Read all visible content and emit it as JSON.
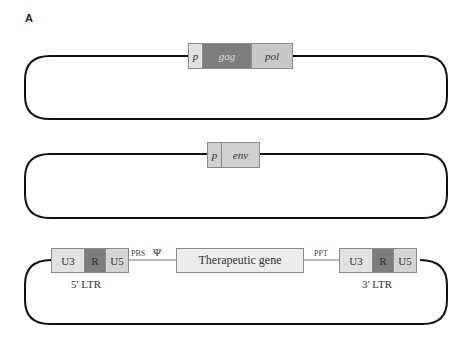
{
  "panel_label": "A",
  "construct1": {
    "segments": [
      {
        "label": "p",
        "color": "#e2e2e2"
      },
      {
        "label": "gag",
        "color": "#7d7d7d"
      },
      {
        "label": "pol",
        "color": "#c8c8c8"
      }
    ]
  },
  "construct2": {
    "segments": [
      {
        "label": "p",
        "color": "#d0d0d0"
      },
      {
        "label": "env",
        "color": "#d0d0d0"
      }
    ]
  },
  "construct3": {
    "ltr5": {
      "u3": "U3",
      "r": "R",
      "u5": "U5",
      "caption": "5' LTR"
    },
    "pbs": "PBS",
    "psi": "Ψ",
    "gene": "Therapeutic gene",
    "ppt": "PPT",
    "ltr3": {
      "u3": "U3",
      "r": "R",
      "u5": "U5",
      "caption": "3' LTR"
    },
    "colors": {
      "u3": "#e2e2e2",
      "r": "#7d7d7d",
      "u5": "#d4d4d4",
      "gene": "#ececec"
    }
  }
}
